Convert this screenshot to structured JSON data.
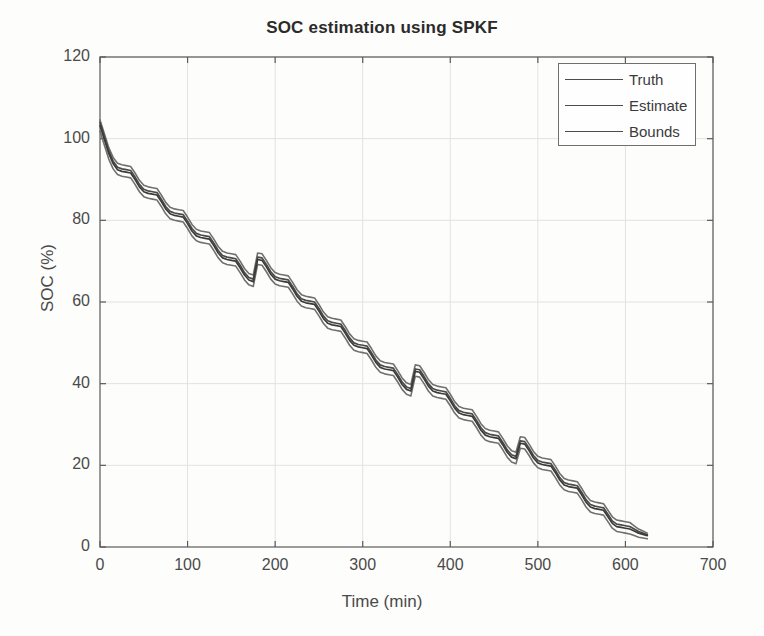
{
  "chart_data": {
    "type": "line",
    "title": "SOC estimation using SPKF",
    "xlabel": "Time (min)",
    "ylabel": "SOC (%)",
    "xlim": [
      0,
      700
    ],
    "ylim": [
      0,
      120
    ],
    "xticks": [
      0,
      100,
      200,
      300,
      400,
      500,
      600,
      700
    ],
    "yticks": [
      0,
      20,
      40,
      60,
      80,
      100,
      120
    ],
    "grid": true,
    "legend_position": "upper right",
    "legend": [
      "Truth",
      "Estimate",
      "Bounds"
    ],
    "colors": {
      "truth": "#4a4a4a",
      "estimate": "#3b3b3b",
      "bounds": "#707070",
      "axis": "#5a5a5a",
      "grid": "#e2e2e2",
      "background": "#fdfdfb"
    },
    "series": [
      {
        "name": "Truth",
        "x": [
          0,
          5,
          10,
          15,
          20,
          25,
          30,
          35,
          40,
          45,
          50,
          55,
          60,
          65,
          70,
          75,
          80,
          85,
          90,
          95,
          100,
          105,
          110,
          115,
          120,
          125,
          130,
          135,
          140,
          145,
          150,
          155,
          160,
          165,
          170,
          175,
          180,
          185,
          190,
          195,
          200,
          205,
          210,
          215,
          220,
          225,
          230,
          235,
          240,
          245,
          250,
          255,
          260,
          265,
          270,
          275,
          280,
          285,
          290,
          295,
          300,
          305,
          310,
          315,
          320,
          325,
          330,
          335,
          340,
          345,
          350,
          355,
          360,
          365,
          370,
          375,
          380,
          385,
          390,
          395,
          400,
          405,
          410,
          415,
          420,
          425,
          430,
          435,
          440,
          445,
          450,
          455,
          460,
          465,
          470,
          475,
          480,
          485,
          490,
          495,
          500,
          505,
          510,
          515,
          520,
          525,
          530,
          535,
          540,
          545,
          550,
          555,
          560,
          565,
          570,
          575,
          580,
          585,
          590,
          595,
          600,
          605,
          610,
          615,
          620,
          625
        ],
        "y": [
          104.0,
          100.5,
          97.0,
          94.5,
          93.0,
          92.6,
          92.4,
          92.2,
          90.6,
          88.8,
          87.6,
          87.2,
          87.0,
          86.8,
          85.2,
          83.4,
          82.2,
          81.8,
          81.6,
          81.4,
          79.8,
          78.0,
          76.8,
          76.4,
          76.2,
          76.0,
          74.4,
          72.6,
          71.4,
          71.0,
          70.8,
          70.6,
          69.0,
          67.2,
          66.0,
          65.6,
          71.0,
          70.8,
          69.2,
          67.4,
          66.2,
          65.8,
          65.6,
          65.4,
          63.8,
          62.0,
          60.8,
          60.4,
          60.2,
          60.0,
          58.4,
          56.6,
          55.4,
          55.0,
          54.8,
          54.6,
          53.0,
          51.2,
          50.0,
          49.6,
          49.4,
          49.2,
          47.6,
          45.8,
          44.6,
          44.2,
          44.0,
          43.8,
          42.2,
          40.4,
          39.2,
          38.8,
          43.6,
          43.4,
          41.8,
          40.0,
          38.8,
          38.4,
          38.2,
          38.0,
          36.4,
          34.6,
          33.4,
          33.0,
          32.8,
          32.6,
          31.0,
          29.2,
          28.0,
          27.6,
          27.4,
          27.2,
          25.6,
          23.8,
          22.6,
          22.2,
          26.0,
          25.8,
          24.2,
          22.4,
          21.2,
          20.8,
          20.6,
          20.4,
          18.8,
          17.0,
          15.8,
          15.4,
          15.2,
          15.0,
          13.4,
          11.6,
          10.4,
          10.0,
          9.8,
          9.6,
          8.0,
          6.4,
          5.6,
          5.4,
          5.2,
          5.0,
          4.4,
          3.8,
          3.4,
          3.0
        ]
      },
      {
        "name": "Estimate",
        "x": [
          0,
          5,
          10,
          15,
          20,
          25,
          30,
          35,
          40,
          45,
          50,
          55,
          60,
          65,
          70,
          75,
          80,
          85,
          90,
          95,
          100,
          105,
          110,
          115,
          120,
          125,
          130,
          135,
          140,
          145,
          150,
          155,
          160,
          165,
          170,
          175,
          180,
          185,
          190,
          195,
          200,
          205,
          210,
          215,
          220,
          225,
          230,
          235,
          240,
          245,
          250,
          255,
          260,
          265,
          270,
          275,
          280,
          285,
          290,
          295,
          300,
          305,
          310,
          315,
          320,
          325,
          330,
          335,
          340,
          345,
          350,
          355,
          360,
          365,
          370,
          375,
          380,
          385,
          390,
          395,
          400,
          405,
          410,
          415,
          420,
          425,
          430,
          435,
          440,
          445,
          450,
          455,
          460,
          465,
          470,
          475,
          480,
          485,
          490,
          495,
          500,
          505,
          510,
          515,
          520,
          525,
          530,
          535,
          540,
          545,
          550,
          555,
          560,
          565,
          570,
          575,
          580,
          585,
          590,
          595,
          600,
          605,
          610,
          615,
          620,
          625
        ],
        "y": [
          103.2,
          99.8,
          96.4,
          93.9,
          92.4,
          92.0,
          91.8,
          91.6,
          90.0,
          88.2,
          87.0,
          86.6,
          86.4,
          86.2,
          84.6,
          82.8,
          81.6,
          81.2,
          81.0,
          80.8,
          79.2,
          77.4,
          76.2,
          75.8,
          75.6,
          75.4,
          73.8,
          72.0,
          70.8,
          70.4,
          70.2,
          70.0,
          68.4,
          66.6,
          65.4,
          65.0,
          70.4,
          70.2,
          68.6,
          66.8,
          65.6,
          65.2,
          65.0,
          64.8,
          63.2,
          61.4,
          60.2,
          59.8,
          59.6,
          59.4,
          57.8,
          56.0,
          54.8,
          54.4,
          54.2,
          54.0,
          52.4,
          50.6,
          49.4,
          49.0,
          48.8,
          48.6,
          47.0,
          45.2,
          44.0,
          43.6,
          43.4,
          43.2,
          41.6,
          39.8,
          38.6,
          38.2,
          43.0,
          42.8,
          41.2,
          39.4,
          38.2,
          37.8,
          37.6,
          37.4,
          35.8,
          34.0,
          32.8,
          32.4,
          32.2,
          32.0,
          30.4,
          28.6,
          27.4,
          27.0,
          26.8,
          26.6,
          25.0,
          23.2,
          22.0,
          21.6,
          25.4,
          25.2,
          23.6,
          21.8,
          20.6,
          20.2,
          20.0,
          19.8,
          18.2,
          16.4,
          15.2,
          14.8,
          14.6,
          14.4,
          12.8,
          11.0,
          9.8,
          9.4,
          9.2,
          9.0,
          7.4,
          5.8,
          5.0,
          4.8,
          4.6,
          4.4,
          3.9,
          3.4,
          3.1,
          2.8
        ]
      },
      {
        "name": "Bounds upper",
        "x": [
          0,
          5,
          10,
          15,
          20,
          25,
          30,
          35,
          40,
          45,
          50,
          55,
          60,
          65,
          70,
          75,
          80,
          85,
          90,
          95,
          100,
          105,
          110,
          115,
          120,
          125,
          130,
          135,
          140,
          145,
          150,
          155,
          160,
          165,
          170,
          175,
          180,
          185,
          190,
          195,
          200,
          205,
          210,
          215,
          220,
          225,
          230,
          235,
          240,
          245,
          250,
          255,
          260,
          265,
          270,
          275,
          280,
          285,
          290,
          295,
          300,
          305,
          310,
          315,
          320,
          325,
          330,
          335,
          340,
          345,
          350,
          355,
          360,
          365,
          370,
          375,
          380,
          385,
          390,
          395,
          400,
          405,
          410,
          415,
          420,
          425,
          430,
          435,
          440,
          445,
          450,
          455,
          460,
          465,
          470,
          475,
          480,
          485,
          490,
          495,
          500,
          505,
          510,
          515,
          520,
          525,
          530,
          535,
          540,
          545,
          550,
          555,
          560,
          565,
          570,
          575,
          580,
          585,
          590,
          595,
          600,
          605,
          610,
          615,
          620,
          625
        ],
        "y": [
          104.6,
          101.2,
          97.8,
          95.4,
          94.0,
          93.6,
          93.4,
          93.2,
          91.6,
          89.8,
          88.6,
          88.2,
          88.0,
          87.8,
          86.2,
          84.4,
          83.2,
          82.8,
          82.6,
          82.4,
          80.8,
          79.0,
          77.8,
          77.4,
          77.2,
          77.0,
          75.4,
          73.6,
          72.4,
          72.0,
          71.8,
          71.6,
          70.0,
          68.2,
          67.0,
          66.6,
          72.0,
          71.8,
          70.2,
          68.4,
          67.2,
          66.8,
          66.6,
          66.4,
          64.8,
          63.0,
          61.8,
          61.4,
          61.2,
          61.0,
          59.4,
          57.6,
          56.4,
          56.0,
          55.8,
          55.6,
          54.0,
          52.2,
          51.0,
          50.6,
          50.4,
          50.2,
          48.6,
          46.8,
          45.6,
          45.2,
          45.0,
          44.8,
          43.2,
          41.4,
          40.2,
          39.8,
          44.6,
          44.4,
          42.8,
          41.0,
          39.8,
          39.4,
          39.2,
          39.0,
          37.4,
          35.6,
          34.4,
          34.0,
          33.8,
          33.6,
          32.0,
          30.2,
          29.0,
          28.6,
          28.4,
          28.2,
          26.6,
          24.8,
          23.6,
          23.2,
          27.0,
          26.8,
          25.2,
          23.4,
          22.2,
          21.8,
          21.6,
          21.4,
          19.8,
          18.0,
          16.8,
          16.4,
          16.2,
          16.0,
          14.4,
          12.6,
          11.4,
          11.0,
          10.8,
          10.6,
          9.0,
          7.4,
          6.6,
          6.4,
          6.2,
          6.0,
          5.2,
          4.4,
          3.9,
          3.4
        ]
      },
      {
        "name": "Bounds lower",
        "x": [
          0,
          5,
          10,
          15,
          20,
          25,
          30,
          35,
          40,
          45,
          50,
          55,
          60,
          65,
          70,
          75,
          80,
          85,
          90,
          95,
          100,
          105,
          110,
          115,
          120,
          125,
          130,
          135,
          140,
          145,
          150,
          155,
          160,
          165,
          170,
          175,
          180,
          185,
          190,
          195,
          200,
          205,
          210,
          215,
          220,
          225,
          230,
          235,
          240,
          245,
          250,
          255,
          260,
          265,
          270,
          275,
          280,
          285,
          290,
          295,
          300,
          305,
          310,
          315,
          320,
          325,
          330,
          335,
          340,
          345,
          350,
          355,
          360,
          365,
          370,
          375,
          380,
          385,
          390,
          395,
          400,
          405,
          410,
          415,
          420,
          425,
          430,
          435,
          440,
          445,
          450,
          455,
          460,
          465,
          470,
          475,
          480,
          485,
          490,
          495,
          500,
          505,
          510,
          515,
          520,
          525,
          530,
          535,
          540,
          545,
          550,
          555,
          560,
          565,
          570,
          575,
          580,
          585,
          590,
          595,
          600,
          605,
          610,
          615,
          620,
          625
        ],
        "y": [
          101.8,
          98.4,
          95.0,
          92.6,
          91.2,
          90.8,
          90.6,
          90.4,
          88.8,
          87.0,
          85.8,
          85.4,
          85.2,
          85.0,
          83.4,
          81.6,
          80.4,
          80.0,
          79.8,
          79.6,
          78.0,
          76.2,
          75.0,
          74.6,
          74.4,
          74.2,
          72.6,
          70.8,
          69.6,
          69.2,
          69.0,
          68.8,
          67.2,
          65.4,
          64.2,
          63.8,
          69.2,
          69.0,
          67.4,
          65.6,
          64.4,
          64.0,
          63.8,
          63.6,
          62.0,
          60.2,
          59.0,
          58.6,
          58.4,
          58.2,
          56.6,
          54.8,
          53.6,
          53.2,
          53.0,
          52.8,
          51.2,
          49.4,
          48.2,
          47.8,
          47.6,
          47.4,
          45.8,
          44.0,
          42.8,
          42.4,
          42.2,
          42.0,
          40.4,
          38.6,
          37.4,
          37.0,
          41.8,
          41.6,
          40.0,
          38.2,
          37.0,
          36.6,
          36.4,
          36.2,
          34.6,
          32.8,
          31.6,
          31.2,
          31.0,
          30.8,
          29.2,
          27.4,
          26.2,
          25.8,
          25.6,
          25.4,
          23.8,
          22.0,
          20.8,
          20.4,
          24.2,
          24.0,
          22.4,
          20.6,
          19.4,
          19.0,
          18.8,
          18.6,
          17.0,
          15.2,
          14.0,
          13.6,
          13.4,
          13.2,
          11.6,
          9.8,
          8.6,
          8.2,
          8.0,
          7.8,
          6.2,
          4.6,
          3.8,
          3.6,
          3.4,
          3.2,
          2.8,
          2.4,
          2.2,
          2.0
        ]
      }
    ]
  },
  "figure": {
    "title": "SOC estimation using SPKF",
    "xlabel": "Time (min)",
    "ylabel": "SOC (%)",
    "legend": {
      "truth": "Truth",
      "estimate": "Estimate",
      "bounds": "Bounds"
    },
    "xticks": [
      "0",
      "100",
      "200",
      "300",
      "400",
      "500",
      "600",
      "700"
    ],
    "yticks": [
      "0",
      "20",
      "40",
      "60",
      "80",
      "100",
      "120"
    ]
  }
}
